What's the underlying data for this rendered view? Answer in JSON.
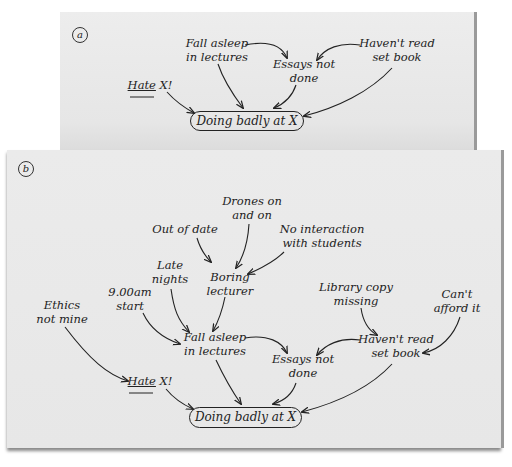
{
  "panels": [
    {
      "id": "a",
      "label": "a",
      "nodes": {
        "fall_asleep": "Fall asleep\nin lectures",
        "essays": "Essays not\ndone",
        "havent_read": "Haven't read\nset book",
        "hate_word": "Hate",
        "hate_rest": " X!",
        "outcome": "Doing badly at X"
      }
    },
    {
      "id": "b",
      "label": "b",
      "nodes": {
        "drones": "Drones on\nand on",
        "out_of_date": "Out of date",
        "no_interaction": "No interaction\nwith students",
        "late_nights": "Late\nnights",
        "boring": "Boring\nlecturer",
        "nine_am": "9.00am\nstart",
        "library": "Library copy\nmissing",
        "cant_afford": "Can't\nafford it",
        "ethics": "Ethics\nnot mine",
        "fall_asleep": "Fall asleep\nin lectures",
        "essays": "Essays not\ndone",
        "havent_read": "Haven't read\nset book",
        "hate_word": "Hate",
        "hate_rest": " X!",
        "outcome": "Doing badly at X"
      }
    }
  ],
  "edges": {
    "a": [
      [
        "fall_asleep",
        "essays"
      ],
      [
        "havent_read",
        "essays"
      ],
      [
        "hate",
        "outcome"
      ],
      [
        "fall_asleep",
        "outcome"
      ],
      [
        "essays",
        "outcome"
      ],
      [
        "havent_read",
        "outcome"
      ]
    ],
    "b": [
      [
        "out_of_date",
        "boring"
      ],
      [
        "drones",
        "boring"
      ],
      [
        "no_interaction",
        "boring"
      ],
      [
        "late_nights",
        "fall_asleep"
      ],
      [
        "boring",
        "fall_asleep"
      ],
      [
        "nine_am",
        "fall_asleep"
      ],
      [
        "library",
        "havent_read"
      ],
      [
        "cant_afford",
        "havent_read"
      ],
      [
        "fall_asleep",
        "essays"
      ],
      [
        "havent_read",
        "essays"
      ],
      [
        "ethics",
        "hate"
      ],
      [
        "hate",
        "outcome"
      ],
      [
        "fall_asleep",
        "outcome"
      ],
      [
        "essays",
        "outcome"
      ],
      [
        "havent_read",
        "outcome"
      ]
    ]
  }
}
